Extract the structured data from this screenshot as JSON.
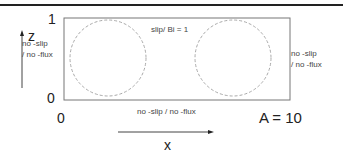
{
  "diagram": {
    "top_label": "slip/ Bi = 1",
    "left_label_line1": "no -slip",
    "left_label_line2": "/ no -flux",
    "right_label_line1": "no -slip",
    "right_label_line2": "/ no -flux",
    "bottom_label": "no -slip / no -flux",
    "z_axis_label": "z",
    "x_axis_label": "x",
    "z_tick_top": "1",
    "z_tick_bottom": "0",
    "x_tick_left": "0",
    "aspect_label": "A = 10",
    "colors": {
      "frame": "#777777",
      "circles": "#aaaaaa",
      "text": "#222222"
    }
  }
}
